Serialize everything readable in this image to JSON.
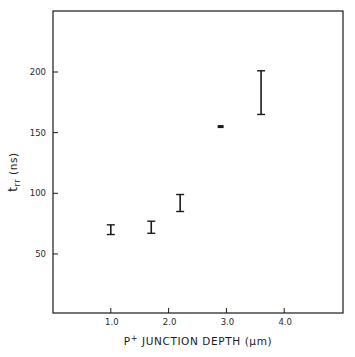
{
  "chart_data": {
    "type": "scatter",
    "title": "",
    "xlabel": "P+ JUNCTION DEPTH (μm)",
    "xlabel_parts": {
      "base": "P",
      "superscript": "+",
      "rest": " JUNCTION DEPTH (μm)"
    },
    "ylabel": "t_rr (ns)",
    "ylabel_parts": {
      "base": "t",
      "subscript": "rr",
      "rest": " (ns)"
    },
    "xlim": [
      0,
      5.0
    ],
    "ylim": [
      0,
      240
    ],
    "x_ticks": [
      1.0,
      2.0,
      3.0,
      4.0
    ],
    "x_tick_labels": [
      "1.0",
      "2.0",
      "3.0",
      "4.0"
    ],
    "y_ticks": [
      50,
      100,
      150,
      200
    ],
    "y_tick_labels": [
      "50",
      "100",
      "150",
      "200"
    ],
    "grid": false,
    "legend": null,
    "series": [
      {
        "name": "t_rr vs junction depth",
        "style": "error-bars",
        "points": [
          {
            "x": 1.0,
            "y": 70,
            "y_low": 66,
            "y_high": 74
          },
          {
            "x": 1.7,
            "y": 72,
            "y_low": 67,
            "y_high": 77
          },
          {
            "x": 2.2,
            "y": 92,
            "y_low": 85,
            "y_high": 99
          },
          {
            "x": 2.9,
            "y": 155,
            "y_low": 155,
            "y_high": 155
          },
          {
            "x": 3.6,
            "y": 183,
            "y_low": 165,
            "y_high": 201
          }
        ]
      }
    ]
  },
  "colors": {
    "ink": "#1a1a1a",
    "background": "#ffffff"
  }
}
